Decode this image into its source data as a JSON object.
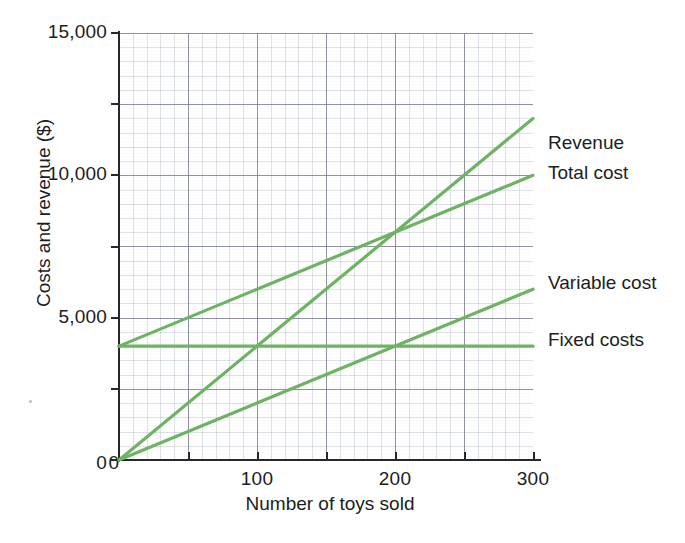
{
  "chart_data": {
    "type": "line",
    "title": "",
    "xlabel": "Number of toys sold",
    "ylabel": "Costs and revenue ($)",
    "xlim": [
      0,
      300
    ],
    "ylim": [
      0,
      15000
    ],
    "x_ticks": [
      "0",
      "100",
      "200",
      "300"
    ],
    "x_tick_values": [
      0,
      100,
      200,
      300
    ],
    "y_ticks": [
      "0",
      "5,000",
      "10,000",
      "15,000"
    ],
    "y_tick_values": [
      0,
      5000,
      10000,
      15000
    ],
    "y_minor_tick_values": [
      2500,
      7500,
      12500
    ],
    "grid": true,
    "legend_position": "right-inline",
    "line_color": "#6eb364",
    "x": [
      0,
      300
    ],
    "series": [
      {
        "name": "Revenue",
        "values": [
          0,
          12000
        ]
      },
      {
        "name": "Total cost",
        "values": [
          4000,
          10000
        ]
      },
      {
        "name": "Variable cost",
        "values": [
          0,
          6000
        ]
      },
      {
        "name": "Fixed costs",
        "values": [
          4000,
          4000
        ]
      }
    ],
    "annotations": [
      {
        "label": "break-even point",
        "x": 200,
        "y": 8000
      }
    ]
  },
  "axes": {
    "y_label": "Costs and revenue ($)",
    "x_label": "Number of toys sold",
    "y_tick_labels": [
      "15,000",
      "10,000",
      "5,000",
      "0"
    ],
    "x_tick_labels": [
      "0",
      "100",
      "200",
      "300"
    ]
  },
  "legend": {
    "items": [
      {
        "label": "Revenue"
      },
      {
        "label": "Total cost"
      },
      {
        "label": "Variable cost"
      },
      {
        "label": "Fixed costs"
      }
    ]
  },
  "colors": {
    "line": "#6eb364",
    "axis": "#25282c",
    "grid_major": "#6e7684",
    "grid_minor": "#96a0af",
    "text": "#1b1d20",
    "background": "#ffffff"
  }
}
